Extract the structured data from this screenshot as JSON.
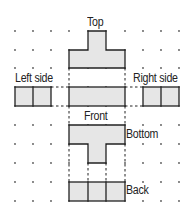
{
  "diagram": {
    "labels": {
      "top": "Top",
      "left_side": "Left side",
      "right_side": "Right side",
      "front": "Front",
      "bottom": "Bottom",
      "back": "Back"
    },
    "colors": {
      "fill": "#e6e6e6",
      "stroke": "#222222",
      "dot": "#444444"
    },
    "grid": {
      "spacing_px": 18.4,
      "columns": 10,
      "rows": 10
    }
  }
}
